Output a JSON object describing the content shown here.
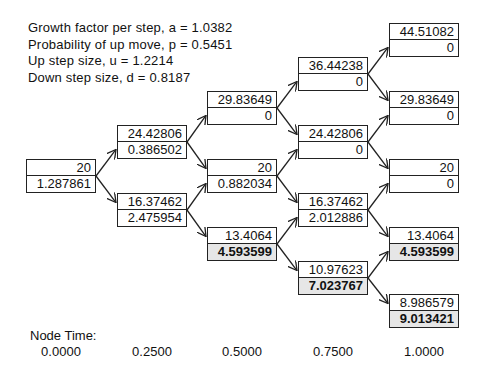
{
  "parameters": [
    "Growth factor per step, a = 1.0382",
    "Probability of up move, p = 0.5451",
    "Up step size, u = 1.2214",
    "Down step size, d = 0.8187"
  ],
  "tree": {
    "t0": [
      {
        "price": "20",
        "value": "1.287861",
        "bold": false
      }
    ],
    "t1": [
      {
        "price": "24.42806",
        "value": "0.386502",
        "bold": false
      },
      {
        "price": "16.37462",
        "value": "2.475954",
        "bold": false
      }
    ],
    "t2": [
      {
        "price": "29.83649",
        "value": "0",
        "bold": false
      },
      {
        "price": "20",
        "value": "0.882034",
        "bold": false
      },
      {
        "price": "13.4064",
        "value": "4.593599",
        "bold": true
      }
    ],
    "t3": [
      {
        "price": "36.44238",
        "value": "0",
        "bold": false
      },
      {
        "price": "24.42806",
        "value": "0",
        "bold": false
      },
      {
        "price": "16.37462",
        "value": "2.012886",
        "bold": false
      },
      {
        "price": "10.97623",
        "value": "7.023767",
        "bold": true
      }
    ],
    "t4": [
      {
        "price": "44.51082",
        "value": "0",
        "bold": false
      },
      {
        "price": "29.83649",
        "value": "0",
        "bold": false
      },
      {
        "price": "20",
        "value": "0",
        "bold": false
      },
      {
        "price": "13.4064",
        "value": "4.593599",
        "bold": true
      },
      {
        "price": "8.986579",
        "value": "9.013421",
        "bold": true
      }
    ]
  },
  "node_time": {
    "label": "Node Time:",
    "values": [
      "0.0000",
      "0.2500",
      "0.5000",
      "0.7500",
      "1.0000"
    ]
  }
}
